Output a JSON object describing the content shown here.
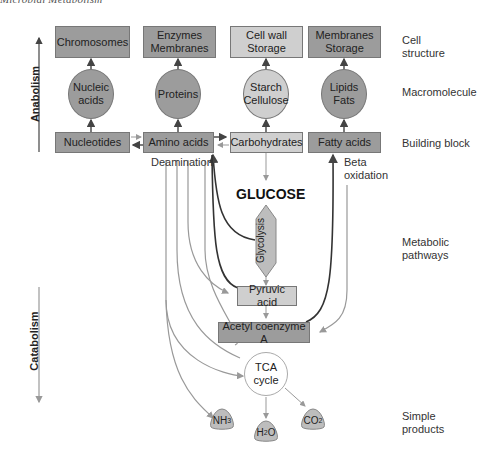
{
  "header": {
    "title": "Microbial Metabolism"
  },
  "axis": {
    "anabolism": "Anabolism",
    "catabolism": "Catabolism"
  },
  "levels": {
    "cell_structure": [
      "Cell",
      "structure"
    ],
    "macromolecule": "Macromolecule",
    "building_block": "Building block",
    "metabolic_pathways": [
      "Metabolic",
      "pathways"
    ],
    "simple_products": [
      "Simple",
      "products"
    ]
  },
  "cell_structures": [
    {
      "lines": [
        "Chromosomes"
      ],
      "shade": "dark"
    },
    {
      "lines": [
        "Enzymes",
        "Membranes"
      ],
      "shade": "dark"
    },
    {
      "lines": [
        "Cell wall",
        "Storage"
      ],
      "shade": "light"
    },
    {
      "lines": [
        "Membranes",
        "Storage"
      ],
      "shade": "dark"
    }
  ],
  "macromolecules": [
    {
      "lines": [
        "Nucleic",
        "acids"
      ],
      "shade": "dark"
    },
    {
      "lines": [
        "Proteins"
      ],
      "shade": "dark"
    },
    {
      "lines": [
        "Starch",
        "Cellulose"
      ],
      "shade": "light"
    },
    {
      "lines": [
        "Lipids",
        "Fats"
      ],
      "shade": "dark"
    }
  ],
  "building_blocks": [
    {
      "label": "Nucleotides",
      "shade": "dark"
    },
    {
      "label": "Amino acids",
      "shade": "dark"
    },
    {
      "label": "Carbohydrates",
      "shade": "light"
    },
    {
      "label": "Fatty acids",
      "shade": "dark"
    }
  ],
  "annotations": {
    "deamination": "Deamination",
    "beta_oxidation": [
      "Beta",
      "oxidation"
    ]
  },
  "pathway": {
    "glucose": "GLUCOSE",
    "glycolysis": "Glycolysis",
    "pyruvic_acid": "Pyruvic acid",
    "acetyl_coa": "Acetyl coenzyme A",
    "tca": [
      "TCA",
      "cycle"
    ]
  },
  "products": [
    {
      "base": "NH",
      "sub": "3"
    },
    {
      "base": "H",
      "sub": "2",
      "tail": "O"
    },
    {
      "base": "CO",
      "sub": "2"
    }
  ],
  "colors": {
    "dark_fill": "#9c9c9c",
    "light_fill": "#cfcfcf",
    "dark_line": "#333333",
    "light_line": "#9a9a9a"
  }
}
